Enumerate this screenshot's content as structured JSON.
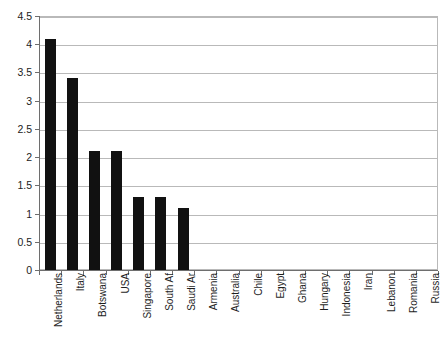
{
  "chart_data": {
    "type": "bar",
    "title": "",
    "subtitle": "",
    "xlabel": "",
    "ylabel": "",
    "ylim": [
      0,
      4.5
    ],
    "ytick_step": 0.5,
    "yticks": [
      "0",
      "0.5",
      "1",
      "1.5",
      "2",
      "2.5",
      "3",
      "3.5",
      "4",
      "4.5"
    ],
    "grid": true,
    "legend": false,
    "legend_position": "none",
    "bar_color": "#111111",
    "categories": [
      "Netherlands",
      "Italy",
      "Botswana",
      "USA",
      "Singapore",
      "South Af",
      "Saudi Ar",
      "Armenia",
      "Australia",
      "Chile",
      "Egypt",
      "Ghana",
      "Hungary",
      "Indonesia",
      "Iran",
      "Lebanon",
      "Romania",
      "Russia"
    ],
    "values": [
      4.1,
      3.4,
      2.1,
      2.1,
      1.3,
      1.3,
      1.1,
      0,
      0,
      0,
      0,
      0,
      0,
      0,
      0,
      0,
      0,
      0
    ]
  },
  "axis": {
    "y_axis_color": "#6e6e6e",
    "grid_color": "#b9b9b9",
    "frame_color": "#b9b9b9"
  }
}
